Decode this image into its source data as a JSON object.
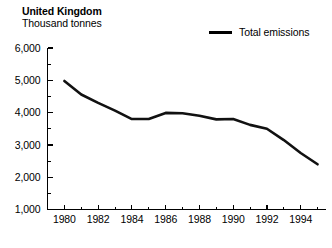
{
  "header": {
    "title": "United Kingdom",
    "subtitle": "Thousand tonnes"
  },
  "legend": {
    "position": "top-right",
    "entries": [
      {
        "label": "Total emissions",
        "color": "#111111",
        "swatch": "line-swatch"
      }
    ]
  },
  "chart_data": {
    "type": "line",
    "title": "United Kingdom",
    "subtitle": "Thousand tonnes",
    "xlabel": "",
    "ylabel": "Thousand tonnes",
    "xlim": [
      1979,
      1995.5
    ],
    "ylim": [
      1000,
      6000
    ],
    "grid": false,
    "legend_position": "top-right",
    "yticks": [
      1000,
      2000,
      3000,
      4000,
      5000,
      6000
    ],
    "ytick_labels": [
      "1,000",
      "2,000",
      "3,000",
      "4,000",
      "5,000",
      "6,000"
    ],
    "yminor_ticks": [
      1500,
      2500,
      3500,
      4500,
      5500
    ],
    "xticks": [
      1979,
      1980,
      1981,
      1982,
      1983,
      1984,
      1985,
      1986,
      1987,
      1988,
      1989,
      1990,
      1991,
      1992,
      1993,
      1994,
      1995
    ],
    "xtick_labels": [
      "1980",
      "1982",
      "1984",
      "1986",
      "1988",
      "1990",
      "1992",
      "1994"
    ],
    "xtick_label_years": [
      1980,
      1982,
      1984,
      1986,
      1988,
      1990,
      1992,
      1994
    ],
    "series": [
      {
        "name": "Total emissions",
        "color": "#111111",
        "x": [
          1980,
          1981,
          1982,
          1983,
          1984,
          1985,
          1986,
          1987,
          1988,
          1989,
          1990,
          1991,
          1992,
          1993,
          1994,
          1995
        ],
        "values": [
          4980,
          4560,
          4300,
          4060,
          3800,
          3800,
          3990,
          3980,
          3900,
          3790,
          3800,
          3620,
          3500,
          3150,
          2750,
          2400
        ]
      }
    ]
  }
}
